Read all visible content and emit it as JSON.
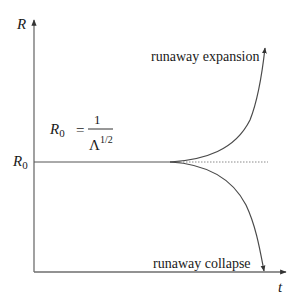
{
  "diagram": {
    "axes": {
      "y_label": "R",
      "x_label": "t",
      "y_tick_label": "R",
      "y_tick_sub": "0"
    },
    "equation": {
      "lhs": "R",
      "lhs_sub": "0",
      "equals": "=",
      "numerator": "1",
      "denominator_base": "Λ",
      "denominator_exp": "1/2"
    },
    "annotations": {
      "upper": "runaway expansion",
      "lower": "runaway collapse"
    },
    "colors": {
      "axis": "#6e6e6e",
      "curve": "#4a4a4a",
      "text": "#1a1a1a",
      "dotted": "#8a8a8a"
    }
  }
}
